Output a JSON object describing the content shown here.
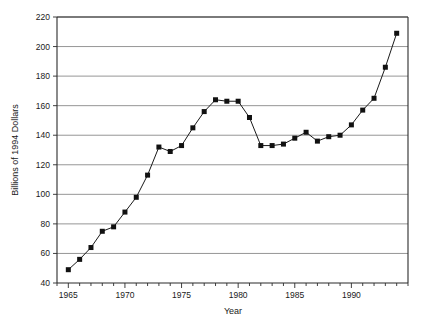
{
  "chart_data": {
    "type": "line",
    "title": "",
    "subtitle": "",
    "xlabel": "Year",
    "ylabel": "Billions of 1994 Dollars",
    "xlim": [
      1964,
      1995
    ],
    "ylim": [
      40,
      220
    ],
    "ytick_step": 20,
    "xtick_step": 1,
    "xtick_label_step": 5,
    "grid": "horizontal",
    "legend": "none",
    "marker": "filled-square",
    "x": [
      1965,
      1966,
      1967,
      1968,
      1969,
      1970,
      1971,
      1972,
      1973,
      1974,
      1975,
      1976,
      1977,
      1978,
      1979,
      1980,
      1981,
      1982,
      1983,
      1984,
      1985,
      1986,
      1987,
      1988,
      1989,
      1990,
      1991,
      1992,
      1993,
      1994
    ],
    "values": [
      49,
      56,
      64,
      75,
      78,
      88,
      98,
      113,
      132,
      129,
      133,
      145,
      156,
      164,
      163,
      163,
      152,
      133,
      133,
      134,
      138,
      142,
      136,
      139,
      140,
      147,
      157,
      165,
      186,
      209
    ],
    "xticks": [
      1964,
      1965,
      1966,
      1967,
      1968,
      1969,
      1970,
      1971,
      1972,
      1973,
      1974,
      1975,
      1976,
      1977,
      1978,
      1979,
      1980,
      1981,
      1982,
      1983,
      1984,
      1985,
      1986,
      1987,
      1988,
      1989,
      1990,
      1991,
      1992,
      1993,
      1994,
      1995
    ],
    "xtick_labels": [
      "1965",
      "1970",
      "1975",
      "1980",
      "1985",
      "1990"
    ],
    "xtick_label_values": [
      1965,
      1970,
      1975,
      1980,
      1985,
      1990
    ],
    "yticks": [
      40,
      60,
      80,
      100,
      120,
      140,
      160,
      180,
      200,
      220
    ],
    "ytick_labels": [
      "40",
      "60",
      "80",
      "100",
      "120",
      "140",
      "160",
      "180",
      "200",
      "220"
    ],
    "colors": {
      "line": "#1a1a1a",
      "marker": "#111111",
      "grid": "#8a8a8a",
      "axis": "#2b2b2b",
      "background": "#ffffff"
    }
  }
}
